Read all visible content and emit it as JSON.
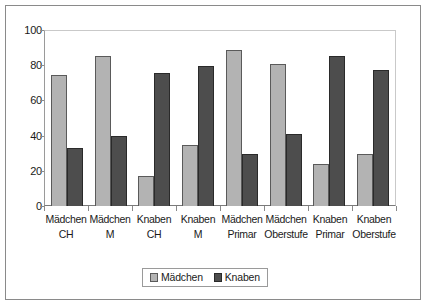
{
  "chart_data": {
    "type": "bar",
    "title": "",
    "xlabel": "",
    "ylabel": "",
    "ylim": [
      0,
      100
    ],
    "yticks": [
      0,
      20,
      40,
      60,
      80,
      100
    ],
    "grid": false,
    "legend_position": "bottom",
    "categories": [
      "Mädchen CH",
      "Mädchen M",
      "Knaben CH",
      "Knaben M",
      "Mädchen Primar",
      "Mädchen Oberstufe",
      "Knaben Primar",
      "Knaben Oberstufe"
    ],
    "category_lines": [
      {
        "line1": "Mädchen",
        "line2": "CH"
      },
      {
        "line1": "Mädchen",
        "line2": "M"
      },
      {
        "line1": "Knaben",
        "line2": "CH"
      },
      {
        "line1": "Knaben M",
        "line2": ""
      },
      {
        "line1": "Mädchen",
        "line2": "Primar"
      },
      {
        "line1": "Mädchen",
        "line2": "Oberstufe"
      },
      {
        "line1": "Knaben",
        "line2": "Primar"
      },
      {
        "line1": "Knaben",
        "line2": "Oberstufe"
      }
    ],
    "series": [
      {
        "name": "Mädchen",
        "color": "#b3b3b3",
        "values": [
          75,
          86,
          17,
          35,
          89,
          81,
          24,
          30
        ]
      },
      {
        "name": "Knaben",
        "color": "#4d4d4d",
        "values": [
          33,
          40,
          76,
          80,
          30,
          41,
          86,
          78
        ]
      }
    ]
  },
  "axis": {
    "y_tick_labels": [
      "100",
      "80",
      "60",
      "40",
      "20",
      "0"
    ]
  },
  "legend": {
    "entries": [
      {
        "label": "Mädchen",
        "color": "#b3b3b3"
      },
      {
        "label": "Knaben",
        "color": "#4d4d4d"
      }
    ]
  }
}
